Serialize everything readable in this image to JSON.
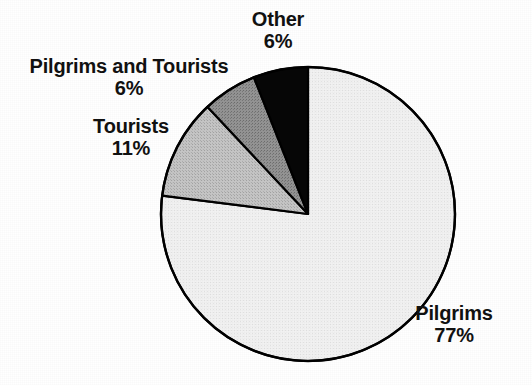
{
  "chart_data": {
    "type": "pie",
    "title": "",
    "subtitle": "",
    "xlabel": "",
    "ylabel": "",
    "legend_position": "none",
    "grid": false,
    "labels_inline": true,
    "unit": "%",
    "start_angle_deg": 0,
    "direction": "clockwise",
    "categories": [
      "Pilgrims",
      "Tourists",
      "Pilgrims and Tourists",
      "Other"
    ],
    "values": [
      77,
      11,
      6,
      6
    ],
    "slices": [
      {
        "name": "Pilgrims",
        "value": 77,
        "value_label": "77%",
        "color": "#f0f0f0",
        "outline": "#000000",
        "label_position": "bottom-right"
      },
      {
        "name": "Tourists",
        "value": 11,
        "value_label": "11%",
        "color": "#bcbcbc",
        "outline": "#000000",
        "label_position": "left"
      },
      {
        "name": "Pilgrims and Tourists",
        "value": 6,
        "value_label": "6%",
        "color": "#8a8a8a",
        "outline": "#000000",
        "label_position": "upper-left"
      },
      {
        "name": "Other",
        "value": 6,
        "value_label": "6%",
        "color": "#000000",
        "outline": "#000000",
        "label_position": "top"
      }
    ],
    "geometry": {
      "center_x": 308,
      "center_y": 214,
      "radius": 147
    }
  },
  "colors": {
    "background": "#ffffff",
    "text": "#111111",
    "outline": "#000000",
    "pilgrims": "#f0f0f0",
    "tourists": "#bcbcbc",
    "pilgrims_and_tourists": "#8a8a8a",
    "other": "#000000"
  }
}
